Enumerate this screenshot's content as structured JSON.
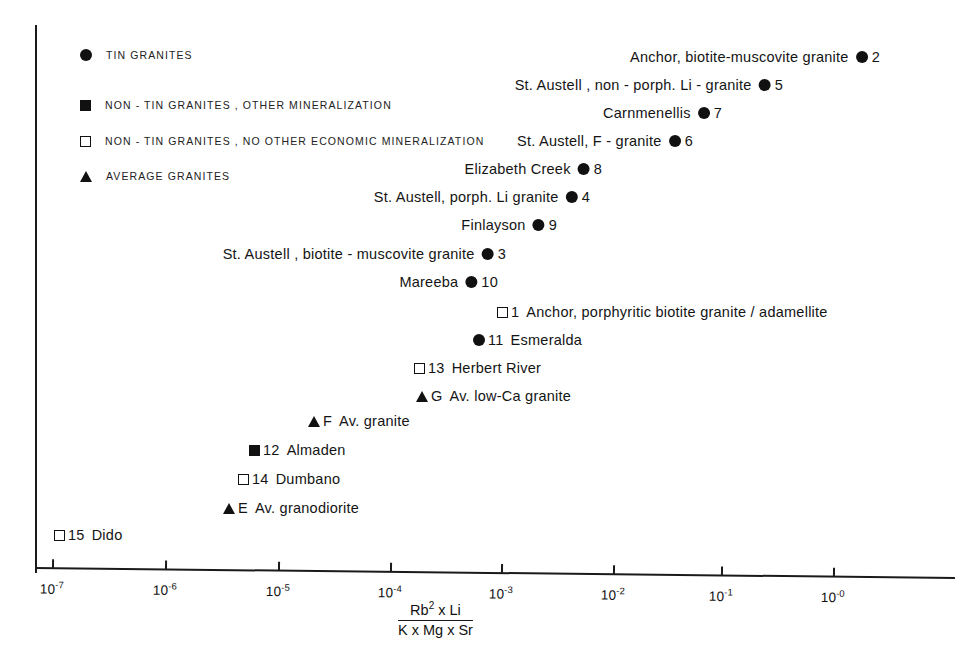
{
  "figure": {
    "background_color": "#ffffff",
    "ink_color": "#111111"
  },
  "legend": {
    "items": [
      {
        "symbol": "filled-circle",
        "label": "TIN   GRANITES"
      },
      {
        "symbol": "filled-square",
        "label": "NON - TIN   GRANITES , OTHER   MINERALIZATION"
      },
      {
        "symbol": "open-square",
        "label": "NON - TIN  GRANITES , NO OTHER   ECONOMIC   MINERALIZATION"
      },
      {
        "symbol": "filled-triangle",
        "label": "AVERAGE   GRANITES"
      }
    ]
  },
  "axis": {
    "title_numerator": "Rb",
    "title_numerator_sup": "2",
    "title_numerator_rest": " x   Li",
    "title_denominator": "K  x  Mg  x  Sr",
    "tick_labels": [
      "10⁻⁷",
      "10⁻⁶",
      "10⁻⁵",
      "10⁻⁴",
      "10⁻³",
      "10⁻²",
      "10⁻¹",
      "10⁻⁰"
    ],
    "tick_mantissa": "10",
    "tick_exponents": [
      "-7",
      "-6",
      "-5",
      "-4",
      "-3",
      "-2",
      "-1",
      "-0"
    ]
  },
  "chart_data": {
    "type": "scatter",
    "title": "",
    "xlabel": "Rb2 x Li / (K x Mg x Sr)",
    "ylabel": "",
    "xscale": "log",
    "xlim": [
      1e-07,
      1.0
    ],
    "xticks": [
      1e-07,
      1e-06,
      1e-05,
      0.0001,
      0.001,
      0.01,
      0.1,
      1.0
    ],
    "grid": false,
    "legend_position": "upper-left",
    "note": "Single-axis ranking plot: points are spread vertically only for label legibility; the y position carries no data value.",
    "series": [
      {
        "name": "TIN GRANITES",
        "symbol": "filled-circle",
        "points": [
          {
            "id": "2",
            "name": "Anchor, biotite-muscovite granite",
            "x": 0.3,
            "label_side": "left"
          },
          {
            "id": "5",
            "name": "St. Austell , non - porph. Li - granite",
            "x": 0.055,
            "label_side": "left"
          },
          {
            "id": "7",
            "name": "Carnmenellis",
            "x": 0.015,
            "label_side": "left"
          },
          {
            "id": "6",
            "name": "St. Austell,  F - granite",
            "x": 0.0085,
            "label_side": "left"
          },
          {
            "id": "8",
            "name": "Elizabeth Creek",
            "x": 0.0018,
            "label_side": "left"
          },
          {
            "id": "4",
            "name": "St. Austell,  porph. Li granite",
            "x": 0.0014,
            "label_side": "left"
          },
          {
            "id": "9",
            "name": "Finlayson",
            "x": 0.00055,
            "label_side": "left"
          },
          {
            "id": "3",
            "name": "St. Austell , biotite - muscovite granite",
            "x": 0.00013,
            "label_side": "left"
          },
          {
            "id": "10",
            "name": "Mareeba",
            "x": 0.00011,
            "label_side": "left"
          },
          {
            "id": "11",
            "name": "Esmeralda",
            "x": 6.5e-05,
            "label_side": "right"
          }
        ]
      },
      {
        "name": "NON-TIN GRANITES, OTHER MINERALIZATION",
        "symbol": "filled-square",
        "points": [
          {
            "id": "12",
            "name": "Almaden",
            "x": 4.5e-06,
            "label_side": "right"
          }
        ]
      },
      {
        "name": "NON-TIN GRANITES, NO OTHER ECONOMIC MINERALIZATION",
        "symbol": "open-square",
        "points": [
          {
            "id": "1",
            "name": "Anchor, porphyritic  biotite  granite / adamellite",
            "x": 0.00011,
            "label_side": "right"
          },
          {
            "id": "13",
            "name": "Herbert   River",
            "x": 1.8e-05,
            "label_side": "right"
          },
          {
            "id": "14",
            "name": "Dumbano",
            "x": 3.4e-06,
            "label_side": "right"
          },
          {
            "id": "15",
            "name": "Dido",
            "x": 1.4e-07,
            "label_side": "right"
          }
        ]
      },
      {
        "name": "AVERAGE GRANITES",
        "symbol": "filled-triangle",
        "points": [
          {
            "id": "G",
            "name": "Av. low-Ca   granite",
            "x": 1.9e-05,
            "label_side": "right"
          },
          {
            "id": "F",
            "name": "Av.  granite",
            "x": 4e-06,
            "label_side": "right"
          },
          {
            "id": "E",
            "name": "Av. granodiorite",
            "x": 2.2e-06,
            "label_side": "right"
          }
        ]
      }
    ]
  },
  "points": [
    {
      "key": "p2",
      "text": "Anchor, biotite-muscovite granite",
      "num": "2",
      "marker": "filled-circle",
      "x": 880,
      "y": 57,
      "side": "left"
    },
    {
      "key": "p5",
      "text": "St. Austell , non - porph. Li - granite",
      "num": "5",
      "marker": "filled-circle",
      "x": 783,
      "y": 85,
      "side": "left"
    },
    {
      "key": "p7",
      "text": "Carnmenellis",
      "num": "7",
      "marker": "filled-circle",
      "x": 722,
      "y": 113,
      "side": "left"
    },
    {
      "key": "p6",
      "text": "St. Austell,  F - granite",
      "num": "6",
      "marker": "filled-circle",
      "x": 693,
      "y": 141,
      "side": "left"
    },
    {
      "key": "p8",
      "text": "Elizabeth Creek",
      "num": "8",
      "marker": "filled-circle",
      "x": 602,
      "y": 169,
      "side": "left"
    },
    {
      "key": "p4",
      "text": "St. Austell,  porph. Li granite",
      "num": "4",
      "marker": "filled-circle",
      "x": 590,
      "y": 197,
      "side": "left"
    },
    {
      "key": "p9",
      "text": "Finlayson",
      "num": "9",
      "marker": "filled-circle",
      "x": 557,
      "y": 225,
      "side": "left"
    },
    {
      "key": "p3",
      "text": "St. Austell , biotite - muscovite granite",
      "num": "3",
      "marker": "filled-circle",
      "x": 506,
      "y": 254,
      "side": "left"
    },
    {
      "key": "p10",
      "text": "Mareeba",
      "num": "10",
      "marker": "filled-circle",
      "x": 498,
      "y": 282,
      "side": "left"
    },
    {
      "key": "p1",
      "text": "Anchor, porphyritic  biotite  granite / adamellite",
      "num": "1",
      "marker": "open-square",
      "x": 497,
      "y": 312,
      "side": "right"
    },
    {
      "key": "p11",
      "text": "Esmeralda",
      "num": "11",
      "marker": "filled-circle",
      "x": 473,
      "y": 340,
      "side": "right"
    },
    {
      "key": "p13",
      "text": "Herbert   River",
      "num": "13",
      "marker": "open-square",
      "x": 414,
      "y": 368,
      "side": "right"
    },
    {
      "key": "pG",
      "text": "Av. low-Ca   granite",
      "num": "G",
      "marker": "filled-triangle",
      "x": 416,
      "y": 396,
      "side": "right"
    },
    {
      "key": "pF",
      "text": "Av.  granite",
      "num": "F",
      "marker": "filled-triangle",
      "x": 308,
      "y": 421,
      "side": "right"
    },
    {
      "key": "p12",
      "text": "Almaden",
      "num": "12",
      "marker": "filled-square",
      "x": 249,
      "y": 450,
      "side": "right"
    },
    {
      "key": "p14",
      "text": "Dumbano",
      "num": "14",
      "marker": "open-square",
      "x": 238,
      "y": 479,
      "side": "right"
    },
    {
      "key": "pE",
      "text": "Av. granodiorite",
      "num": "E",
      "marker": "filled-triangle",
      "x": 223,
      "y": 508,
      "side": "right"
    },
    {
      "key": "p15",
      "text": "Dido",
      "num": "15",
      "marker": "open-square",
      "x": 54,
      "y": 535,
      "side": "right"
    }
  ]
}
